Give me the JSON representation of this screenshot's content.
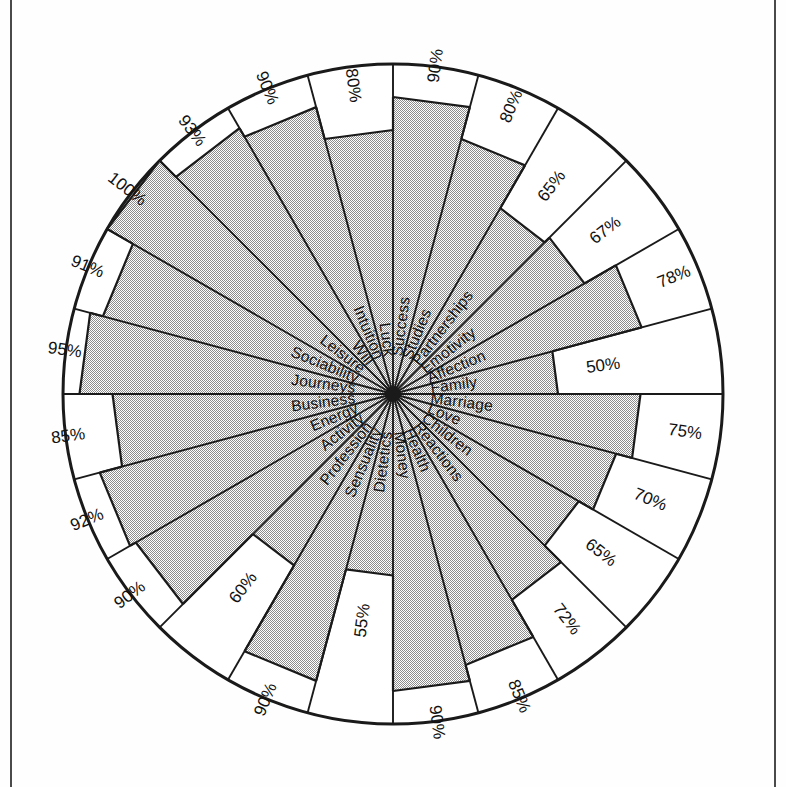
{
  "figure": {
    "kind": "radar-wheel",
    "outer_ring_note": "scale ring 0-100%",
    "fill_color": "#c9c9c9",
    "line_color": "#1a1a1a",
    "background_color": "#ffffff"
  },
  "chart_data": {
    "type": "pie",
    "title": "",
    "subtitle": "",
    "xlabel": "",
    "ylabel": "",
    "ylim": [
      0,
      100
    ],
    "grid": false,
    "legend": "none",
    "axis_units": "%",
    "sector_count": 24,
    "start_angle_deg": -90,
    "direction": "clockwise",
    "categories": [
      "Success",
      "Studies",
      "Partnerships",
      "Emotivity",
      "Affection",
      "Family",
      "Marriage",
      "Love",
      "Children",
      "Reactions",
      "Health",
      "Money",
      "Dietetics",
      "Sensuality",
      "Profession",
      "Activity",
      "Energy",
      "Business",
      "Journeys",
      "Sociability",
      "Leisure",
      "Will",
      "Intuition",
      "Luck"
    ],
    "values": [
      90,
      80,
      65,
      67,
      78,
      50,
      75,
      70,
      65,
      72,
      85,
      90,
      55,
      90,
      60,
      90,
      92,
      85,
      95,
      91,
      100,
      93,
      90,
      80
    ],
    "value_labels": [
      "90%",
      "80%",
      "65%",
      "67%",
      "78%",
      "50%",
      "75%",
      "70%",
      "65%",
      "72%",
      "85%",
      "90%",
      "55%",
      "90%",
      "60%",
      "90%",
      "92%",
      "85%",
      "95%",
      "91%",
      "100%",
      "93%",
      "90%",
      "80%"
    ]
  }
}
